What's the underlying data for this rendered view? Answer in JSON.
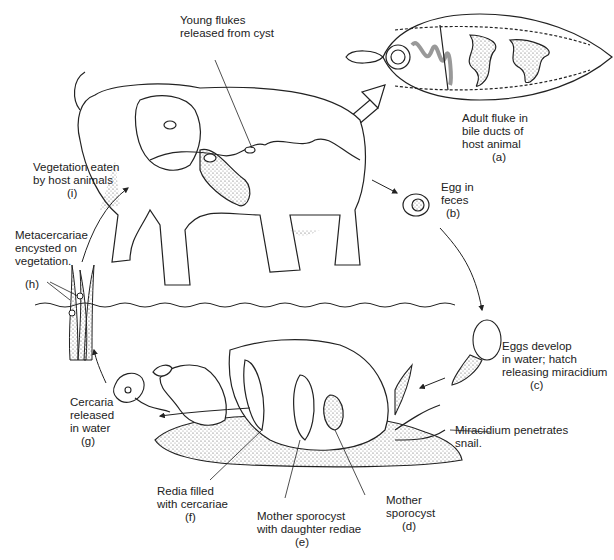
{
  "diagram": {
    "stages": [
      {
        "id": "a",
        "lines": [
          "Adult fluke in",
          "bile ducts of",
          "host animal"
        ],
        "tag": "(a)"
      },
      {
        "id": "b",
        "lines": [
          "Egg in",
          "feces"
        ],
        "tag": "(b)"
      },
      {
        "id": "c",
        "lines": [
          "Eggs develop",
          "in water; hatch",
          "releasing miracidium"
        ],
        "tag": "(c)"
      },
      {
        "id": "d",
        "lines": [
          "Mother",
          "sporocyst"
        ],
        "tag": "(d)"
      },
      {
        "id": "e",
        "lines": [
          "Mother sporocyst",
          "with daughter rediae"
        ],
        "tag": "(e)"
      },
      {
        "id": "f",
        "lines": [
          "Redia filled",
          "with cercariae"
        ],
        "tag": "(f)"
      },
      {
        "id": "g",
        "lines": [
          "Cercaria",
          "released",
          "in water"
        ],
        "tag": "(g)"
      },
      {
        "id": "h",
        "lines": [
          "Metacercariae",
          "encysted on",
          "vegetation."
        ],
        "tag": "(h)"
      },
      {
        "id": "i",
        "lines": [
          "Vegetation eaten",
          "by host animals"
        ],
        "tag": "(i)"
      }
    ],
    "annotations": {
      "young_flukes": [
        "Young flukes",
        "released from cyst"
      ],
      "miracidium_penetrates": [
        "Miracidium penetrates",
        "snail."
      ]
    }
  }
}
